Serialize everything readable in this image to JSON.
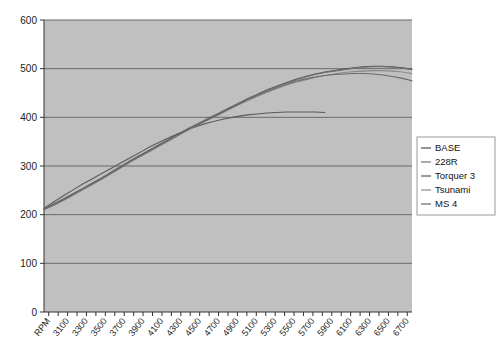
{
  "chart_data": {
    "type": "line",
    "title": "",
    "subtitle": "",
    "xlabel": "",
    "ylabel": "",
    "x_axis_leading_label": "RPM",
    "grid": true,
    "legend_position": "right",
    "plot_background": "#c0c0c0",
    "gridline_color": "#6b6b6b",
    "axis_color": "#333333",
    "ylim": [
      0,
      600
    ],
    "ytick_values": [
      0,
      100,
      200,
      300,
      400,
      500,
      600
    ],
    "ytick_labels": [
      "0",
      "100",
      "200",
      "300",
      "400",
      "500",
      "600"
    ],
    "xtick_labels": [
      "RPM",
      "3100",
      "3300",
      "3500",
      "3700",
      "3900",
      "4100",
      "4300",
      "4500",
      "4700",
      "4900",
      "5100",
      "5300",
      "5500",
      "5700",
      "5900",
      "6100",
      "6300",
      "6500",
      "6700"
    ],
    "x": [
      3000,
      3100,
      3200,
      3300,
      3400,
      3500,
      3600,
      3700,
      3800,
      3900,
      4000,
      4100,
      4200,
      4300,
      4400,
      4500,
      4600,
      4700,
      4800,
      4900,
      5000,
      5100,
      5200,
      5300,
      5400,
      5500,
      5600,
      5700,
      5800,
      5900,
      6000,
      6100,
      6200,
      6300,
      6400,
      6500,
      6600,
      6700,
      6800
    ],
    "xlim": [
      3000,
      6800
    ],
    "series": [
      {
        "name": "BASE",
        "color": "#4f4f4f",
        "values": [
          212,
          222,
          232,
          243,
          254,
          265,
          276,
          288,
          300,
          312,
          323,
          334,
          345,
          356,
          367,
          378,
          388,
          398,
          408,
          418,
          428,
          438,
          447,
          456,
          464,
          471,
          478,
          484,
          489,
          493,
          496,
          499,
          502,
          504,
          505,
          505,
          504,
          502,
          499
        ]
      },
      {
        "name": "228R",
        "color": "#737373",
        "values": [
          211,
          221,
          231,
          242,
          253,
          264,
          275,
          287,
          299,
          311,
          322,
          333,
          344,
          355,
          366,
          377,
          387,
          397,
          407,
          417,
          427,
          437,
          446,
          455,
          463,
          470,
          477,
          483,
          488,
          492,
          495,
          498,
          501,
          503,
          504,
          504,
          503,
          501,
          498
        ]
      },
      {
        "name": "Torquer 3",
        "color": "#5a5a5a",
        "values": [
          213,
          226,
          239,
          251,
          263,
          274,
          285,
          296,
          307,
          318,
          329,
          340,
          350,
          359,
          368,
          376,
          383,
          389,
          394,
          398,
          402,
          405,
          407,
          409,
          410,
          411,
          411,
          411,
          411,
          410,
          null,
          null,
          null,
          null,
          null,
          null,
          null,
          null,
          null
        ]
      },
      {
        "name": "Tsunami",
        "color": "#8a8a8a",
        "values": [
          210,
          219,
          229,
          240,
          251,
          262,
          273,
          285,
          297,
          309,
          320,
          331,
          342,
          353,
          364,
          375,
          385,
          395,
          405,
          415,
          425,
          434,
          443,
          451,
          459,
          466,
          472,
          477,
          482,
          486,
          489,
          492,
          494,
          495,
          496,
          496,
          495,
          493,
          490
        ]
      },
      {
        "name": "MS 4",
        "color": "#6a6a6a",
        "values": [
          211,
          220,
          230,
          241,
          252,
          263,
          274,
          286,
          298,
          310,
          321,
          332,
          343,
          354,
          365,
          376,
          386,
          396,
          406,
          416,
          426,
          436,
          445,
          453,
          461,
          468,
          474,
          479,
          483,
          486,
          488,
          489,
          490,
          490,
          489,
          487,
          484,
          480,
          475
        ]
      }
    ]
  },
  "legend": {
    "entries": [
      {
        "label": "BASE",
        "color": "#4f4f4f"
      },
      {
        "label": "228R",
        "color": "#737373"
      },
      {
        "label": "Torquer 3",
        "color": "#5a5a5a"
      },
      {
        "label": "Tsunami",
        "color": "#8a8a8a"
      },
      {
        "label": "MS 4",
        "color": "#6a6a6a"
      }
    ]
  }
}
